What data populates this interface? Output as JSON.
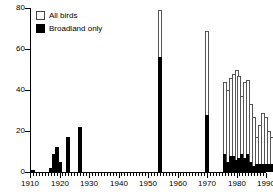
{
  "chart_data": {
    "type": "bar",
    "title": "",
    "subtitle": "",
    "xlabel": "",
    "ylabel": "",
    "xlim": [
      1910,
      1990
    ],
    "ylim": [
      0,
      80
    ],
    "grid": false,
    "stacked": true,
    "legend_position": "top-left",
    "y_ticks": [
      0,
      20,
      40,
      60,
      80
    ],
    "y_tick_labels": [
      "0",
      "20",
      "40",
      "60",
      "80"
    ],
    "x_ticks": [
      1910,
      1920,
      1930,
      1940,
      1950,
      1960,
      1970,
      1980,
      1990
    ],
    "x_tick_labels": [
      "1910",
      "1920",
      "1930",
      "1940",
      "1950",
      "1960",
      "1970",
      "1980",
      "1990"
    ],
    "x_minor_tick_step": 1,
    "series": [
      {
        "name": "All birds",
        "color": "#ffffff",
        "edge_color": "#555555",
        "values": [
          1,
          2,
          9,
          12,
          5,
          17,
          22,
          79,
          69,
          44,
          40,
          46,
          48,
          50,
          47,
          37,
          44,
          45,
          33,
          27,
          17,
          23,
          29,
          27,
          20,
          17
        ]
      },
      {
        "name": "Broadland only",
        "color": "#000000",
        "edge_color": "#000000",
        "values": [
          1,
          2,
          9,
          12,
          5,
          17,
          22,
          56,
          28,
          9,
          5,
          8,
          8,
          6,
          7,
          9,
          7,
          9,
          5,
          3,
          4,
          4,
          4,
          4,
          4,
          4
        ]
      }
    ],
    "x": [
      1911,
      1917,
      1918,
      1919,
      1920,
      1923,
      1927,
      1954,
      1970,
      1976,
      1977,
      1978,
      1979,
      1980,
      1981,
      1982,
      1983,
      1984,
      1985,
      1986,
      1987,
      1988,
      1989,
      1990,
      1991,
      1992
    ]
  },
  "legend": {
    "items": [
      {
        "label": "All birds",
        "swatch": "open-square-swatch"
      },
      {
        "label": "Broadland only",
        "swatch": "filled-square-swatch"
      }
    ]
  }
}
